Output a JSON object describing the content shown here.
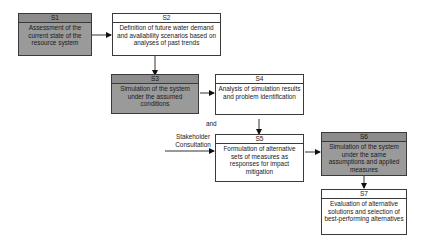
{
  "diagram": {
    "steps": [
      {
        "id": "S1",
        "label": "S1",
        "text": "Assessment of the current state of the resource system",
        "shaded": true
      },
      {
        "id": "S2",
        "label": "S2",
        "text": "Definition of future water demand and availability scenarios based on analyses of past trends",
        "shaded": false
      },
      {
        "id": "S3",
        "label": "S3",
        "text": "Simulation of the system under the assumed conditions",
        "shaded": true
      },
      {
        "id": "S4",
        "label": "S4",
        "text": "Analysis of simulation results and problem identification",
        "shaded": false
      },
      {
        "id": "S5",
        "label": "S5",
        "text": "Formulation of alternative sets of measures as responses for impact mitigation",
        "shaded": false
      },
      {
        "id": "S6",
        "label": "S6",
        "text": "Simulation of the system under the same assumptions and applied measures",
        "shaded": true
      },
      {
        "id": "S7",
        "label": "S7",
        "text": "Evaluation of alternative solutions and selection of best-performing alternatives",
        "shaded": false
      }
    ],
    "annotations": {
      "and": "and",
      "stakeholder": "Stakeholder Consultation"
    },
    "edges": [
      [
        "S1",
        "S2"
      ],
      [
        "S2",
        "S3"
      ],
      [
        "S3",
        "S4"
      ],
      [
        "S4",
        "S5"
      ],
      [
        "Stakeholder Consultation",
        "S5"
      ],
      [
        "S5",
        "S6"
      ],
      [
        "S6",
        "S7"
      ]
    ],
    "colors": {
      "shaded": "#9a9a9a",
      "border": "#3a3a3a",
      "background": "#ffffff"
    }
  }
}
